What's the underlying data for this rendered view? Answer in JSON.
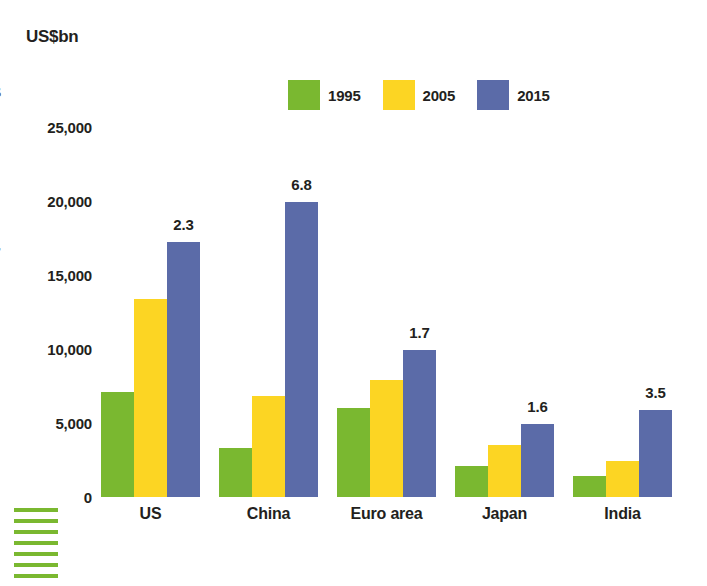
{
  "axis_title": "US$bn",
  "bleed_glyphs": [
    "s",
    "r"
  ],
  "colors": {
    "green": "#7ab830",
    "yellow": "#fcd523",
    "blue": "#5b6ba8",
    "text": "#231f20"
  },
  "legend": {
    "items": [
      {
        "label": "1995",
        "color": "#7ab830",
        "swatch_name": "legend-swatch-1995"
      },
      {
        "label": "2005",
        "color": "#fcd523",
        "swatch_name": "legend-swatch-2005"
      },
      {
        "label": "2015",
        "color": "#5b6ba8",
        "swatch_name": "legend-swatch-2015"
      }
    ]
  },
  "chart_data": {
    "type": "bar",
    "title": "",
    "xlabel": "",
    "ylabel": "US$bn",
    "ylim": [
      0,
      27500
    ],
    "grid": false,
    "legend_position": "top-center",
    "yticks": [
      0,
      5000,
      10000,
      15000,
      20000,
      25000
    ],
    "ytick_labels": [
      "0",
      "5,000",
      "10,000",
      "15,000",
      "20,000",
      "25,000"
    ],
    "categories": [
      "US",
      "China",
      "Euro area",
      "Japan",
      "India"
    ],
    "series": [
      {
        "name": "1995",
        "color": "#7ab830",
        "values": [
          7100,
          3300,
          6000,
          2100,
          1400
        ]
      },
      {
        "name": "2005",
        "color": "#fcd523",
        "values": [
          13400,
          6800,
          7900,
          3500,
          2400
        ]
      },
      {
        "name": "2015",
        "color": "#5b6ba8",
        "values": [
          17200,
          19900,
          9900,
          4900,
          5900
        ]
      }
    ],
    "annotations": [
      {
        "category": "US",
        "series": "2015",
        "text": "2.3"
      },
      {
        "category": "China",
        "series": "2015",
        "text": "6.8"
      },
      {
        "category": "Euro area",
        "series": "2015",
        "text": "1.7"
      },
      {
        "category": "Japan",
        "series": "2015",
        "text": "1.6"
      },
      {
        "category": "India",
        "series": "2015",
        "text": "3.5"
      }
    ]
  },
  "decoration": {
    "rule_count": 7,
    "rule_color": "#7ab830"
  }
}
